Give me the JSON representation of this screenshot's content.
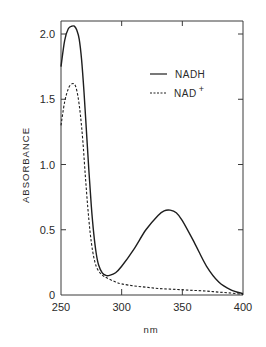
{
  "chart_data": {
    "type": "line",
    "title": "",
    "xlabel": "nm",
    "ylabel": "ABSORBANCE",
    "xlim": [
      250,
      400
    ],
    "ylim": [
      0,
      2.1
    ],
    "x_ticks": [
      250,
      300,
      350,
      400
    ],
    "x_tick_labels": [
      "250",
      "300",
      "350",
      "400"
    ],
    "y_ticks": [
      0,
      0.5,
      1.0,
      1.5,
      2.0
    ],
    "y_tick_labels": [
      "0",
      "0.5",
      "1.0",
      "1.5",
      "2.0"
    ],
    "grid": false,
    "legend_position": "top-right",
    "series": [
      {
        "name": "NADH",
        "style": "solid",
        "x": [
          250,
          253,
          256,
          259,
          261,
          263,
          265,
          267,
          269,
          271,
          273,
          275,
          277,
          279,
          281,
          284,
          287,
          290,
          295,
          300,
          310,
          320,
          330,
          335,
          340,
          345,
          350,
          360,
          370,
          380,
          390,
          400
        ],
        "y": [
          1.75,
          1.95,
          2.04,
          2.06,
          2.06,
          2.03,
          1.96,
          1.8,
          1.55,
          1.25,
          0.95,
          0.68,
          0.47,
          0.32,
          0.23,
          0.17,
          0.15,
          0.15,
          0.17,
          0.22,
          0.35,
          0.5,
          0.61,
          0.645,
          0.65,
          0.63,
          0.57,
          0.4,
          0.22,
          0.1,
          0.04,
          0.01
        ]
      },
      {
        "name": "NAD+",
        "style": "dashed",
        "x": [
          250,
          253,
          256,
          258,
          260,
          262,
          264,
          266,
          268,
          270,
          272,
          274,
          276,
          278,
          280,
          283,
          286,
          290,
          295,
          300,
          310,
          320,
          330,
          340,
          350,
          360,
          370,
          380,
          390,
          400
        ],
        "y": [
          1.3,
          1.48,
          1.58,
          1.61,
          1.62,
          1.6,
          1.52,
          1.38,
          1.18,
          0.92,
          0.68,
          0.48,
          0.34,
          0.25,
          0.2,
          0.16,
          0.14,
          0.12,
          0.1,
          0.085,
          0.07,
          0.06,
          0.05,
          0.045,
          0.04,
          0.035,
          0.03,
          0.022,
          0.015,
          0.005
        ]
      }
    ]
  },
  "legend": {
    "items": [
      {
        "label": "NADH",
        "style": "solid"
      },
      {
        "label": "NAD",
        "superscript": "+",
        "style": "dashed"
      }
    ]
  },
  "colors": {
    "line": "#1e1e1e",
    "axis": "#3a3a3a"
  }
}
